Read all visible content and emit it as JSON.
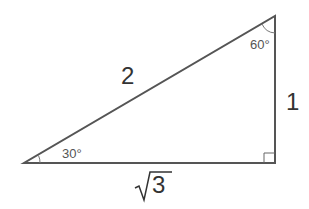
{
  "triangle": {
    "vertices": {
      "A": [
        24,
        163
      ],
      "B": [
        275,
        163
      ],
      "C": [
        275,
        16
      ]
    },
    "stroke_color": "#555555"
  },
  "labels": {
    "hypotenuse": "2",
    "vertical_side": "1",
    "base_radicand": "3",
    "angle_bottom_left": "30°",
    "angle_top": "60°"
  }
}
